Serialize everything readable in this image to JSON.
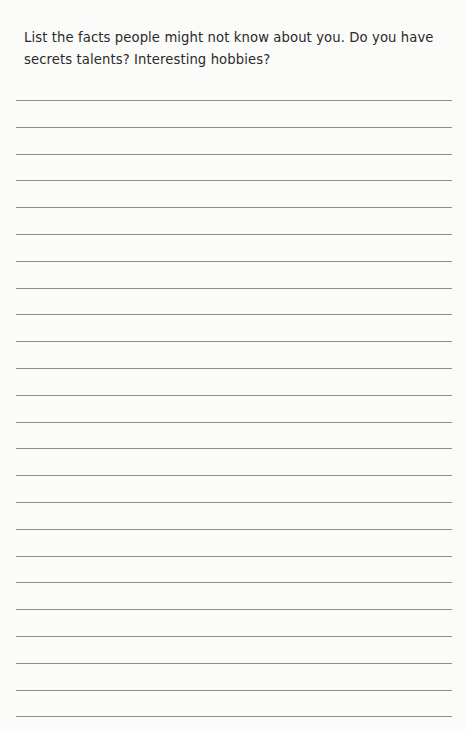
{
  "prompt": {
    "text": "List the facts people might not know about you. Do you have secrets talents? Interesting hobbies?"
  },
  "writing_area": {
    "line_count": 24,
    "first_line_y": 100,
    "line_spacing": 26.8,
    "line_color": "#8e8e8e"
  }
}
